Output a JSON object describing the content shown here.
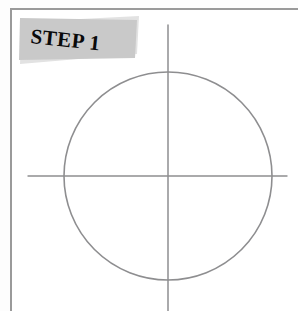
{
  "page": {
    "title": "STEP 1",
    "background_color": "#ffffff",
    "border_color": "#9a9a9a"
  },
  "banner": {
    "label": "STEP 1",
    "fill_color": "#c9c9c9",
    "shadow_color": "#e2e2e2",
    "text_color": "#0a0a0a",
    "shape": "slanted-parallelogram"
  },
  "drawing": {
    "description": "Pencil construction sketch: a circle with vertical and horizontal center guide lines",
    "stroke_color": "#8e8e90",
    "stroke_width": 1.4,
    "circle": {
      "center_x": 168,
      "center_y": 176,
      "radius": 104
    },
    "vertical_axis": {
      "x": 168,
      "y_start": 25,
      "y_end": 311
    },
    "horizontal_axis": {
      "y": 176,
      "x_start": 28,
      "x_end": 287
    }
  },
  "icons": {
    "circle": "circle-outline-icon",
    "crosshair": "crosshair-guides-icon"
  }
}
